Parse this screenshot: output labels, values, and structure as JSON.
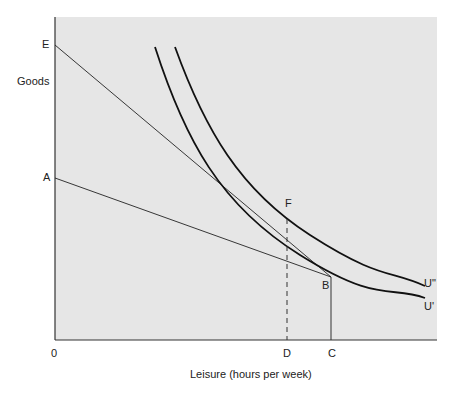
{
  "diagram": {
    "type": "indifference-curve-budget-line",
    "y_axis_label": "Goods",
    "x_axis_label": "Leisure (hours per week)",
    "origin_label": "0",
    "point_labels": {
      "E": "E",
      "A": "A",
      "F": "F",
      "B": "B",
      "D": "D",
      "C": "C"
    },
    "curve_labels": {
      "u_double_prime": "U\"",
      "u_prime": "U'"
    },
    "elements": [
      {
        "id": "budget-line-EB",
        "from": "E",
        "to": "beyond F toward B",
        "style": "solid thin"
      },
      {
        "id": "budget-line-AB",
        "from": "A",
        "to": "B",
        "style": "solid thin"
      },
      {
        "id": "indifference-curve-U-prime",
        "label": "U'",
        "passes_through": [
          "B"
        ],
        "style": "solid thick"
      },
      {
        "id": "indifference-curve-U-double-prime",
        "label": "U\"",
        "passes_through": [
          "F"
        ],
        "style": "solid thick"
      },
      {
        "id": "line-F-D",
        "from": "F",
        "to": "D",
        "style": "dashed"
      },
      {
        "id": "line-B-C",
        "from": "B",
        "to": "C",
        "style": "solid"
      }
    ],
    "colors": {
      "panel_bg": "#e6e6e6",
      "line": "#1a1a1a",
      "page_bg": "#ffffff"
    }
  }
}
